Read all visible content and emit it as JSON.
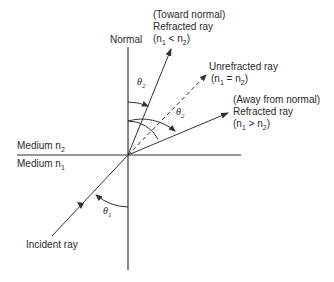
{
  "diagram": {
    "labels": {
      "normal": "Normal",
      "medium_top": "Medium n",
      "medium_top_sub": "2",
      "medium_bottom": "Medium n",
      "medium_bottom_sub": "1",
      "incident": "Incident ray",
      "theta1": "θ",
      "theta1_sub": "1",
      "theta2_top": "θ",
      "theta2_top_sub": "2",
      "theta2_right": "θ",
      "theta2_right_sub": "2"
    },
    "toward": {
      "line1": "(Toward normal)",
      "line2": "Refracted ray",
      "cond_open": "(n",
      "cond_sub1": "1",
      "cond_op": " < n",
      "cond_sub2": "2",
      "cond_close": ")"
    },
    "unrefracted": {
      "line1": "Unrefracted ray",
      "cond_open": "(n",
      "cond_sub1": "1",
      "cond_op": " = n",
      "cond_sub2": "2",
      "cond_close": ")"
    },
    "away": {
      "line1": "(Away from normal)",
      "line2": "Refracted ray",
      "cond_open": "(n",
      "cond_sub1": "1",
      "cond_op": " > n",
      "cond_sub2": "2",
      "cond_close": ")"
    },
    "colors": {
      "stroke": "#333333",
      "text": "#2a2a2a"
    }
  }
}
